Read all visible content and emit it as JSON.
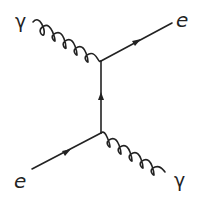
{
  "diagram": {
    "type": "feynman-diagram",
    "line_color": "#222222",
    "background": "#ffffff",
    "labels": {
      "photon_in": "γ",
      "electron_out": "e",
      "electron_in": "e",
      "photon_out": "γ"
    },
    "vertices": [
      {
        "name": "top-vertex",
        "x": 101,
        "y": 61
      },
      {
        "name": "bottom-vertex",
        "x": 101,
        "y": 133
      }
    ],
    "edges": [
      {
        "name": "incoming-photon",
        "kind": "photon",
        "from": [
          33,
          22
        ],
        "to": [
          101,
          61
        ]
      },
      {
        "name": "outgoing-electron",
        "kind": "fermion",
        "from": [
          101,
          61
        ],
        "to": [
          172,
          23
        ],
        "arrow": "forward"
      },
      {
        "name": "internal-electron-propagator",
        "kind": "fermion",
        "from": [
          101,
          133
        ],
        "to": [
          101,
          61
        ],
        "arrow": "up"
      },
      {
        "name": "incoming-electron",
        "kind": "fermion",
        "from": [
          32,
          169
        ],
        "to": [
          101,
          133
        ],
        "arrow": "forward"
      },
      {
        "name": "outgoing-photon",
        "kind": "photon",
        "from": [
          101,
          133
        ],
        "to": [
          165,
          172
        ]
      }
    ]
  }
}
